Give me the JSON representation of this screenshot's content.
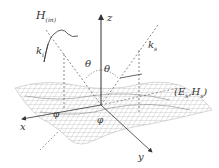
{
  "diagram": {
    "labels": {
      "incident_field": "H",
      "incident_field_sub": "(in)",
      "incident_wavevector": "k",
      "incident_wavevector_sub": "i",
      "scattered_wavevector": "k",
      "scattered_wavevector_sub": "s",
      "z_axis": "z",
      "x_axis": "x",
      "y_axis": "y",
      "theta_incident": "θ",
      "theta_scattered": "θ",
      "phi_incident": "φ",
      "phi_scattered": "φ",
      "scattered_field": "(E",
      "scattered_field_sub1": "s",
      "scattered_field_mid": ",H",
      "scattered_field_sub2": "s",
      "scattered_field_end": ")"
    },
    "colors": {
      "axis": "#333333",
      "mesh": "#9a9a9a",
      "dashed": "#555555"
    }
  }
}
